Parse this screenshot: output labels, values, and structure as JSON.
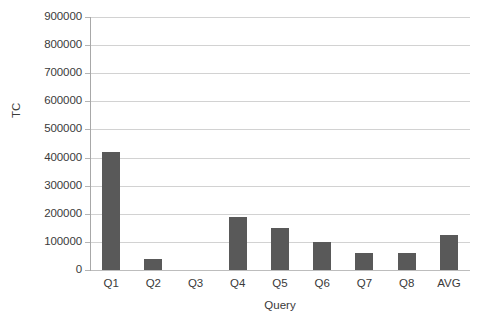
{
  "chart_data": {
    "type": "bar",
    "title": "",
    "xlabel": "Query",
    "ylabel": "TC",
    "categories": [
      "Q1",
      "Q2",
      "Q3",
      "Q4",
      "Q5",
      "Q6",
      "Q7",
      "Q8",
      "AVG"
    ],
    "values": [
      420000,
      40000,
      0,
      190000,
      150000,
      100000,
      60000,
      60000,
      125000
    ],
    "ylim": [
      0,
      900000
    ],
    "ytick_labels": [
      "900000",
      "800000",
      "700000",
      "600000",
      "500000",
      "400000",
      "300000",
      "200000",
      "100000",
      "0"
    ],
    "ytick_values": [
      900000,
      800000,
      700000,
      600000,
      500000,
      400000,
      300000,
      200000,
      100000,
      0
    ],
    "ytick_step": 100000,
    "grid": true,
    "legend": false,
    "bar_color": "#595959",
    "gridline_color": "#d2d2d2",
    "axis_color": "#a8a8a8",
    "background": "#ffffff"
  }
}
